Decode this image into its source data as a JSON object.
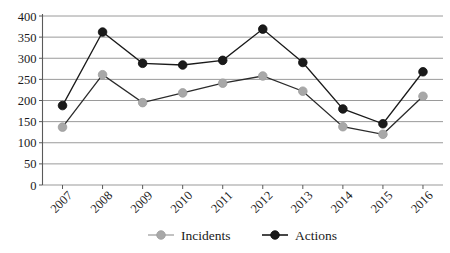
{
  "chart_data": {
    "type": "line",
    "title": "",
    "xlabel": "",
    "ylabel": "",
    "categories": [
      "2007",
      "2008",
      "2009",
      "2010",
      "2011",
      "2012",
      "2013",
      "2014",
      "2015",
      "2016"
    ],
    "series": [
      {
        "name": "Incidents",
        "color": "#a8a8a8",
        "values": [
          137,
          261,
          195,
          218,
          241,
          258,
          222,
          138,
          120,
          210
        ]
      },
      {
        "name": "Actions",
        "color": "#1a1a1a",
        "values": [
          188,
          362,
          288,
          284,
          295,
          369,
          290,
          180,
          145,
          268
        ]
      }
    ],
    "ylim": [
      0,
      400
    ],
    "yticks": [
      0,
      50,
      100,
      150,
      200,
      250,
      300,
      350,
      400
    ],
    "ytick_labels": [
      "0",
      "50",
      "100",
      "150",
      "200",
      "250",
      "300",
      "350",
      "400"
    ],
    "grid": true,
    "grid_color": "#9a9a9a",
    "legend_position": "bottom",
    "legend": [
      {
        "label": "Incidents",
        "color": "#a8a8a8"
      },
      {
        "label": "Actions",
        "color": "#1a1a1a"
      }
    ]
  },
  "axis": {
    "tick_label_rotation": "-45"
  }
}
